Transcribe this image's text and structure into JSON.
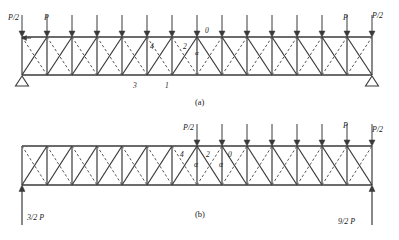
{
  "figure": {
    "type": "structural-truss-diagram",
    "stroke_color": "#3a3a3a",
    "dash_color": "#555555"
  },
  "geometry": {
    "panel_count": 14,
    "x_left": 22,
    "x_right": 372,
    "panel_width": 25,
    "panel_a": {
      "top_y": 37,
      "bottom_y": 75
    },
    "panel_b": {
      "top_y": 146,
      "bottom_y": 185
    }
  },
  "panel_a": {
    "caption": "(a)",
    "caption_x": 195,
    "caption_y": 98,
    "load_labels": [
      {
        "text": "P/2",
        "x": 8,
        "y": 14
      },
      {
        "text": "P",
        "x": 44,
        "y": 14
      },
      {
        "text": "P",
        "x": 343,
        "y": 14
      },
      {
        "text": "P/2",
        "x": 372,
        "y": 12
      }
    ],
    "node_labels": [
      {
        "text": "0",
        "x": 205,
        "y": 27
      },
      {
        "text": "2",
        "x": 183,
        "y": 43
      },
      {
        "text": "4",
        "x": 150,
        "y": 43
      },
      {
        "text": "1",
        "x": 165,
        "y": 82
      },
      {
        "text": "3",
        "x": 133,
        "y": 82
      }
    ],
    "angle_labels": [
      {
        "text": "α",
        "x": 195,
        "y": 50
      }
    ],
    "loads": {
      "end_label": "P/2",
      "interior_label": "P",
      "count": 15,
      "direction": "down"
    },
    "supports": [
      {
        "type": "pin-triangle",
        "x": 22,
        "y": 75
      },
      {
        "type": "pin-triangle",
        "x": 372,
        "y": 75
      }
    ]
  },
  "panel_b": {
    "caption": "(b)",
    "caption_x": 195,
    "caption_y": 210,
    "load_labels": [
      {
        "text": "P/2",
        "x": 183,
        "y": 124
      },
      {
        "text": "P",
        "x": 343,
        "y": 122
      },
      {
        "text": "P/2",
        "x": 372,
        "y": 126
      }
    ],
    "node_labels": [
      {
        "text": "4",
        "x": 180,
        "y": 151
      },
      {
        "text": "2",
        "x": 206,
        "y": 151
      },
      {
        "text": "0",
        "x": 228,
        "y": 151
      },
      {
        "text": "α",
        "x": 194,
        "y": 161
      },
      {
        "text": "α",
        "x": 219,
        "y": 161
      }
    ],
    "loads": {
      "end_label": "P/2",
      "interior_label": "P",
      "first_loaded_node_index": 7,
      "direction": "down"
    },
    "reactions": [
      {
        "text": "3/2 P",
        "x": 27,
        "y": 214,
        "arrow_x": 22,
        "direction": "up"
      },
      {
        "text": "9/2 P",
        "x": 338,
        "y": 218,
        "arrow_x": 372,
        "direction": "up"
      }
    ]
  }
}
